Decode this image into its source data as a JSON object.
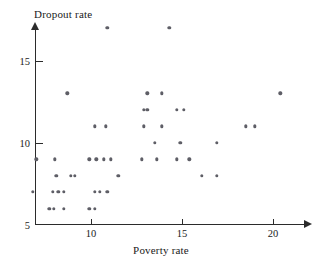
{
  "chart_data": {
    "type": "scatter",
    "title": "",
    "xlabel": "Poverty rate",
    "ylabel": "Dropout rate",
    "xlim": [
      6.5,
      21.5
    ],
    "ylim": [
      5,
      17.6
    ],
    "xticks": [
      10,
      15,
      20
    ],
    "yticks": [
      5,
      10,
      15
    ],
    "xticklabels": [
      "10",
      "15",
      "20"
    ],
    "yticklabels": [
      "5",
      "10",
      "15"
    ],
    "grid": false,
    "legend": null,
    "marker": "filled-circle",
    "marker_color": "#5e5e66",
    "axis_color": "#2b2b2b",
    "points": [
      {
        "x": 10.9,
        "y": 17.0
      },
      {
        "x": 14.3,
        "y": 17.0
      },
      {
        "x": 8.7,
        "y": 13.0
      },
      {
        "x": 13.1,
        "y": 13.0
      },
      {
        "x": 13.9,
        "y": 13.0
      },
      {
        "x": 20.4,
        "y": 13.0
      },
      {
        "x": 12.9,
        "y": 12.0
      },
      {
        "x": 13.1,
        "y": 12.0
      },
      {
        "x": 14.7,
        "y": 12.0
      },
      {
        "x": 15.1,
        "y": 12.0
      },
      {
        "x": 10.2,
        "y": 11.0
      },
      {
        "x": 10.8,
        "y": 11.0
      },
      {
        "x": 12.9,
        "y": 11.0
      },
      {
        "x": 13.9,
        "y": 11.0
      },
      {
        "x": 18.5,
        "y": 11.0
      },
      {
        "x": 19.0,
        "y": 11.0
      },
      {
        "x": 13.5,
        "y": 10.0
      },
      {
        "x": 14.9,
        "y": 10.0
      },
      {
        "x": 16.9,
        "y": 10.0
      },
      {
        "x": 7.0,
        "y": 9.0
      },
      {
        "x": 8.0,
        "y": 9.0
      },
      {
        "x": 9.9,
        "y": 9.0
      },
      {
        "x": 10.3,
        "y": 9.0
      },
      {
        "x": 10.7,
        "y": 9.0
      },
      {
        "x": 11.1,
        "y": 9.0
      },
      {
        "x": 12.8,
        "y": 9.0
      },
      {
        "x": 13.6,
        "y": 9.0
      },
      {
        "x": 14.7,
        "y": 9.0
      },
      {
        "x": 15.4,
        "y": 9.0
      },
      {
        "x": 8.1,
        "y": 8.0
      },
      {
        "x": 8.9,
        "y": 8.0
      },
      {
        "x": 9.1,
        "y": 8.0
      },
      {
        "x": 11.5,
        "y": 8.0
      },
      {
        "x": 16.1,
        "y": 8.0
      },
      {
        "x": 16.9,
        "y": 8.0
      },
      {
        "x": 6.8,
        "y": 7.0
      },
      {
        "x": 7.9,
        "y": 7.0
      },
      {
        "x": 8.2,
        "y": 7.0
      },
      {
        "x": 8.5,
        "y": 7.0
      },
      {
        "x": 10.2,
        "y": 7.0
      },
      {
        "x": 10.5,
        "y": 7.0
      },
      {
        "x": 10.9,
        "y": 7.0
      },
      {
        "x": 7.7,
        "y": 6.0
      },
      {
        "x": 7.95,
        "y": 6.0
      },
      {
        "x": 8.5,
        "y": 6.0
      },
      {
        "x": 9.9,
        "y": 6.0
      },
      {
        "x": 10.2,
        "y": 6.0
      }
    ]
  }
}
